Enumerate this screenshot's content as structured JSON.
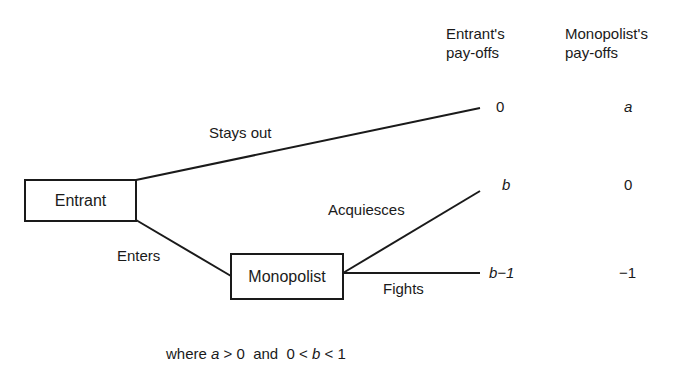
{
  "headers": {
    "entrant_payoffs_line1": "Entrant's",
    "entrant_payoffs_line2": "pay-offs",
    "monopolist_payoffs_line1": "Monopolist's",
    "monopolist_payoffs_line2": "pay-offs"
  },
  "nodes": {
    "entrant": "Entrant",
    "monopolist": "Monopolist"
  },
  "branches": {
    "stays_out": "Stays out",
    "enters": "Enters",
    "acquiesces": "Acquiesces",
    "fights": "Fights"
  },
  "payoffs": [
    {
      "outcome": "Stays out",
      "entrant": "0",
      "monopolist": "a"
    },
    {
      "outcome": "Acquiesces",
      "entrant": "b",
      "monopolist": "0"
    },
    {
      "outcome": "Fights",
      "entrant": "b−1",
      "monopolist": "−1"
    }
  ],
  "footer": {
    "prefix": "where ",
    "a": "a",
    "gt0": " > 0  and  0 < ",
    "b": "b",
    "lt1": " < 1"
  }
}
